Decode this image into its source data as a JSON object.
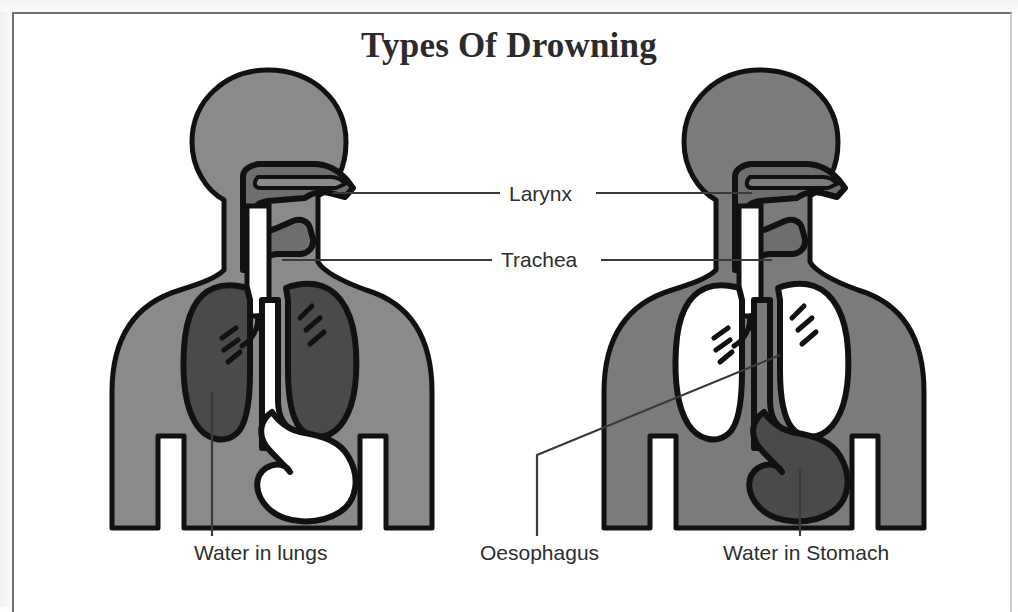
{
  "page": {
    "title": "Types Of Drowning",
    "background_color": "#ffffff",
    "frame_color": "#6f6f6f"
  },
  "colors": {
    "outline": "#111111",
    "body_left": "#8a8a8a",
    "body_right": "#7b7b7b",
    "cavity_fill": "#6e6e6e",
    "water_fill": "#4a4a4a",
    "air_fill": "#ffffff",
    "leader_line": "#3a3a3a",
    "text": "#2e2e2e"
  },
  "labels": {
    "larynx": "Larynx",
    "trachea": "Trachea",
    "water_in_lungs": "Water in lungs",
    "oesophagus": "Oesophagus",
    "water_in_stomach": "Water in Stomach"
  },
  "figures": [
    {
      "id": "left",
      "caption": "Water in lungs",
      "lungs_state": "water-filled",
      "lungs_fill": "#4a4a4a",
      "stomach_state": "empty",
      "stomach_fill": "#ffffff",
      "body_fill": "#8a8a8a"
    },
    {
      "id": "right",
      "caption": "Water in Stomach",
      "lungs_state": "empty",
      "lungs_fill": "#ffffff",
      "stomach_state": "water-filled",
      "stomach_fill": "#4a4a4a",
      "body_fill": "#7b7b7b"
    }
  ],
  "annotations": [
    {
      "name": "larynx",
      "label": "Larynx",
      "leader": "both-sides-horizontal"
    },
    {
      "name": "trachea",
      "label": "Trachea",
      "leader": "both-sides-horizontal"
    },
    {
      "name": "water-in-lungs",
      "label": "Water in lungs",
      "leader": "vertical-up-into-left-lung"
    },
    {
      "name": "oesophagus",
      "label": "Oesophagus",
      "leader": "elbow-up-right-to-carina"
    },
    {
      "name": "water-in-stomach",
      "label": "Water in Stomach",
      "leader": "vertical-up-into-stomach"
    }
  ]
}
